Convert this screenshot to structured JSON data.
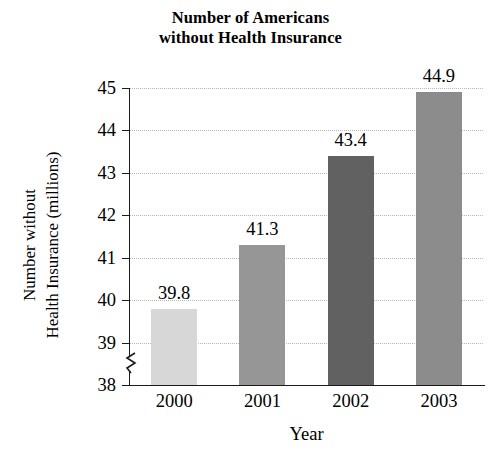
{
  "chart_data": {
    "type": "bar",
    "title": "Number of Americans without Health Insurance",
    "title_lines": [
      "Number of Americans",
      "without Health Insurance"
    ],
    "xlabel": "Year",
    "ylabel": "Number without Health Insurance (millions)",
    "ylabel_lines": [
      "Number without",
      "Health Insurance (millions)"
    ],
    "categories": [
      "2000",
      "2001",
      "2002",
      "2003"
    ],
    "values": [
      39.8,
      41.3,
      43.4,
      44.9
    ],
    "data_labels": [
      "39.8",
      "41.3",
      "43.4",
      "44.9"
    ],
    "ylim": [
      38,
      45
    ],
    "yticks": [
      38,
      39,
      40,
      41,
      42,
      43,
      44,
      45
    ],
    "ytick_labels": [
      "38",
      "39",
      "40",
      "41",
      "42",
      "43",
      "44",
      "45"
    ],
    "axis_break": true,
    "axis_break_icon": "axis-break-zigzag",
    "grid": true,
    "grid_style": "dotted",
    "grid_color": "#b9b9b9",
    "legend": "none",
    "bar_colors": [
      "#d7d7d7",
      "#969696",
      "#616161",
      "#8c8c8c"
    ],
    "axis_color": "#1a1a1a",
    "background": "#ffffff"
  }
}
